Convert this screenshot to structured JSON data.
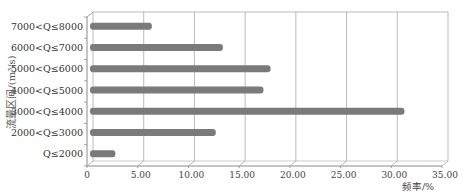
{
  "chart_data": {
    "type": "bar",
    "orientation": "horizontal",
    "title": "",
    "xlabel": "频率/%",
    "ylabel": "流量区间/(m³/s)",
    "categories": [
      "Q≤2000",
      "2000<Q≤3000",
      "3000<Q≤4000",
      "4000<Q≤5000",
      "5000<Q≤6000",
      "6000<Q≤7000",
      "7000<Q≤8000"
    ],
    "values": [
      2.5,
      12.4,
      31.0,
      17.1,
      17.8,
      13.1,
      6.1
    ],
    "xlim": [
      0,
      35
    ],
    "xticks": [
      "0",
      "5.00",
      "10.00",
      "15.00",
      "20.00",
      "25.00",
      "30.00",
      "35.00"
    ],
    "grid": true,
    "style": "3d",
    "legend": null,
    "colors": {
      "bar": "#7a7a7a",
      "grid": "#a8a8a8",
      "axis": "#8a8a8a"
    }
  }
}
